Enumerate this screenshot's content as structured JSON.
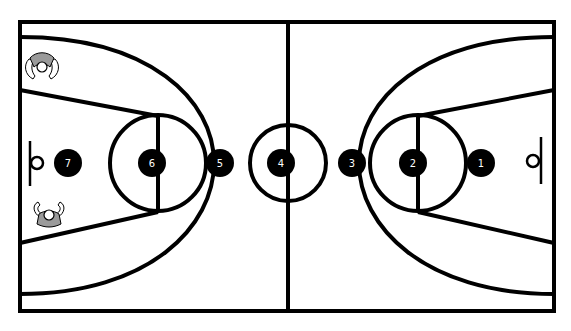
{
  "diagram": {
    "type": "basketball-half-court-positions",
    "colors": {
      "lines": "#000000",
      "background": "#ffffff",
      "marker_fill": "#000000",
      "marker_text": "#ffffff",
      "player_jersey": "#9a9a9a"
    },
    "markers": [
      {
        "label": "1",
        "x": 481,
        "y": 163
      },
      {
        "label": "2",
        "x": 413,
        "y": 163
      },
      {
        "label": "3",
        "x": 352,
        "y": 163
      },
      {
        "label": "4",
        "x": 281,
        "y": 163
      },
      {
        "label": "5",
        "x": 220,
        "y": 163
      },
      {
        "label": "6",
        "x": 152,
        "y": 163
      },
      {
        "label": "7",
        "x": 68,
        "y": 163
      }
    ],
    "players": [
      {
        "name": "player-top-left-corner",
        "x": 42,
        "y": 65
      },
      {
        "name": "player-bottom-left-lane",
        "x": 49,
        "y": 219
      }
    ]
  }
}
